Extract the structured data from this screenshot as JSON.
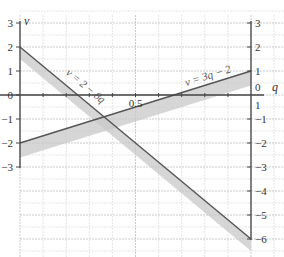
{
  "chart_data": {
    "type": "line",
    "title": "",
    "xlabel": "q",
    "ylabel": "v",
    "xlim": [
      0,
      1
    ],
    "ylim": [
      -6.5,
      3
    ],
    "grid": true,
    "left_axis_ticks": [
      3,
      2,
      1,
      0,
      -1,
      -2,
      -3
    ],
    "right_axis_ticks": [
      3,
      2,
      1,
      0,
      -1,
      -2,
      -3,
      -4,
      -5,
      -6
    ],
    "x_ticks": [
      {
        "value": 0.5,
        "label": "0.5"
      },
      {
        "value": 1,
        "label": "1"
      }
    ],
    "series": [
      {
        "name": "v = 2 − 8q",
        "label": "v = 2 − 8q",
        "x": [
          0,
          1
        ],
        "values": [
          2,
          -6
        ],
        "shaded_band_below": 0.5
      },
      {
        "name": "v = 3q − 2",
        "label": "v = 3q − 2",
        "x": [
          0,
          1
        ],
        "values": [
          -2,
          1
        ],
        "shaded_band_below": 0.6
      }
    ],
    "intersection": {
      "q": 0.364,
      "v": -0.91
    }
  },
  "colors": {
    "line": "#555555",
    "axis": "#444444",
    "band": "#c8c8c8",
    "grid_major": "#bbbbbb",
    "grid_minor": "#dddddd"
  }
}
